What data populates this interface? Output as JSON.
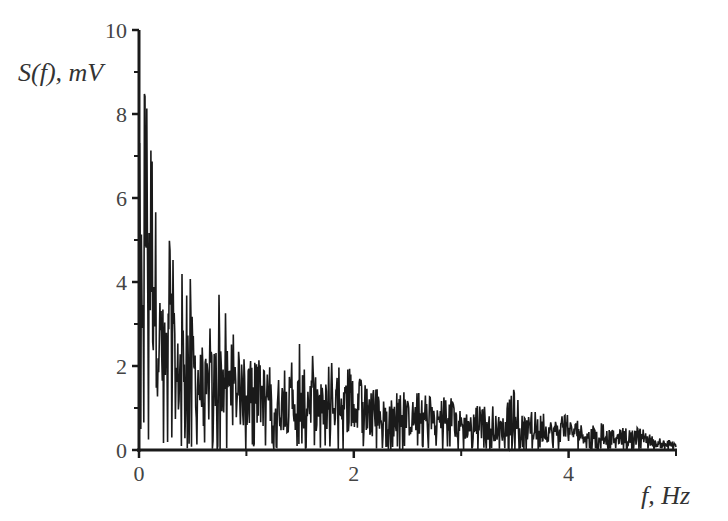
{
  "chart_data": {
    "type": "line",
    "title": "",
    "xlabel": "f, Hz",
    "ylabel": "S(f), mV",
    "xlim": [
      0,
      5
    ],
    "ylim": [
      0,
      10
    ],
    "x_ticks": [
      0,
      2,
      4
    ],
    "x_minor_ticks": [
      1,
      3,
      5
    ],
    "y_ticks": [
      0,
      2,
      4,
      6,
      8,
      10
    ],
    "y_minor_ticks": [
      1,
      3,
      5,
      7,
      9
    ],
    "grid": false,
    "legend": null,
    "series": [
      {
        "name": "S(f)",
        "color": "#1a1a1a",
        "description": "Noisy amplitude spectrum decaying with frequency",
        "envelope_x": [
          0.0,
          0.02,
          0.05,
          0.08,
          0.1,
          0.13,
          0.16,
          0.2,
          0.25,
          0.3,
          0.35,
          0.4,
          0.45,
          0.5,
          0.6,
          0.7,
          0.75,
          0.8,
          0.9,
          1.0,
          1.1,
          1.2,
          1.3,
          1.4,
          1.5,
          1.6,
          1.7,
          1.8,
          1.9,
          2.0,
          2.2,
          2.4,
          2.6,
          2.8,
          3.0,
          3.2,
          3.4,
          3.5,
          3.6,
          3.8,
          4.0,
          4.2,
          4.4,
          4.6,
          4.7,
          4.8,
          5.0
        ],
        "envelope_peak": [
          10.0,
          6.5,
          9.2,
          8.9,
          8.1,
          8.9,
          6.7,
          3.6,
          3.1,
          6.0,
          3.1,
          4.5,
          4.2,
          4.1,
          2.5,
          3.4,
          4.2,
          3.3,
          2.6,
          2.1,
          2.4,
          2.5,
          2.2,
          2.0,
          2.7,
          2.6,
          2.0,
          2.2,
          2.3,
          1.8,
          1.5,
          1.4,
          1.4,
          1.3,
          1.2,
          1.1,
          1.0,
          1.5,
          1.0,
          0.9,
          0.9,
          0.7,
          0.6,
          0.5,
          0.6,
          0.3,
          0.2
        ],
        "envelope_mean": [
          5.0,
          3.5,
          6.0,
          5.5,
          5.0,
          4.8,
          3.5,
          2.3,
          2.0,
          2.6,
          1.6,
          2.0,
          2.2,
          2.0,
          1.3,
          1.6,
          1.8,
          1.6,
          1.4,
          1.2,
          1.3,
          1.3,
          1.1,
          1.0,
          1.2,
          1.2,
          1.0,
          1.1,
          1.1,
          0.9,
          0.8,
          0.75,
          0.75,
          0.7,
          0.6,
          0.55,
          0.5,
          0.55,
          0.5,
          0.45,
          0.45,
          0.35,
          0.3,
          0.3,
          0.35,
          0.15,
          0.1
        ]
      }
    ]
  },
  "axes": {
    "x_label": "f, Hz",
    "y_label": "S(f), mV",
    "x_tick_labels": [
      "0",
      "2",
      "4"
    ],
    "y_tick_labels": [
      "0",
      "2",
      "4",
      "6",
      "8",
      "10"
    ]
  }
}
